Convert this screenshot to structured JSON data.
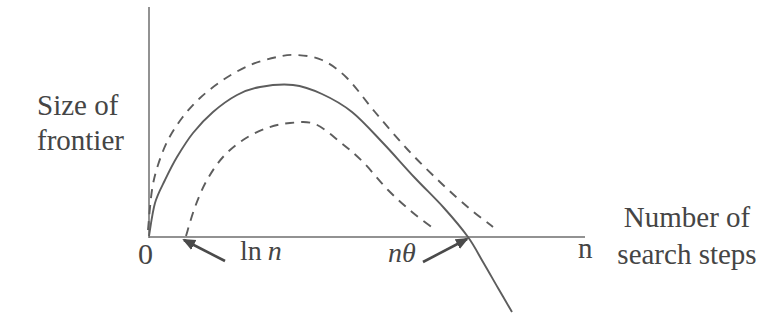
{
  "labels": {
    "y_axis": {
      "line1": "Size of",
      "line2": "frontier"
    },
    "x_axis": {
      "line1": "Number of",
      "line2": "search steps"
    },
    "origin": "0",
    "x_end": "n",
    "ln_n": {
      "prefix": "ln",
      "variable": "n"
    },
    "n_theta": {
      "variable": "n",
      "symbol": "θ"
    }
  },
  "colors": {
    "background": "#ffffff",
    "axis_line": "#6e6e6e",
    "curve_line": "#5d5d5d",
    "arrow_line": "#4a4a4a",
    "text": "#454545"
  },
  "chart_data": {
    "type": "line",
    "title": "",
    "xlabel": "Number of search steps",
    "ylabel": "Size of frontier",
    "x_tick_labels": [
      "0",
      "n"
    ],
    "x_annotations": [
      "ln n",
      "nθ"
    ],
    "grid": false,
    "legend": false,
    "canvas_px": {
      "width": 783,
      "height": 330
    },
    "axes_px": {
      "y_axis": [
        [
          149,
          7
        ],
        [
          149,
          238
        ]
      ],
      "x_axis": [
        [
          149,
          237
        ],
        [
          585,
          237
        ]
      ]
    },
    "series": [
      {
        "name": "frontier-size-solid-curve",
        "style": "solid",
        "points_px": [
          [
            149,
            236
          ],
          [
            155,
            203
          ],
          [
            165,
            180
          ],
          [
            177,
            157
          ],
          [
            193,
            133
          ],
          [
            213,
            112
          ],
          [
            237,
            95
          ],
          [
            260,
            87
          ],
          [
            293,
            85
          ],
          [
            322,
            94
          ],
          [
            352,
            112
          ],
          [
            383,
            143
          ],
          [
            415,
            178
          ],
          [
            444,
            208
          ],
          [
            468,
            237
          ],
          [
            483,
            262
          ],
          [
            498,
            288
          ],
          [
            512,
            312
          ]
        ]
      },
      {
        "name": "upper-dashed-curve",
        "style": "dashed",
        "points_px": [
          [
            148,
            230
          ],
          [
            152,
            190
          ],
          [
            158,
            165
          ],
          [
            168,
            140
          ],
          [
            182,
            118
          ],
          [
            200,
            98
          ],
          [
            223,
            80
          ],
          [
            250,
            65
          ],
          [
            277,
            57
          ],
          [
            297,
            55
          ],
          [
            322,
            60
          ],
          [
            347,
            78
          ],
          [
            375,
            112
          ],
          [
            408,
            150
          ],
          [
            441,
            183
          ],
          [
            470,
            209
          ],
          [
            493,
            227
          ]
        ]
      },
      {
        "name": "lower-dashed-curve",
        "style": "dashed",
        "points_px": [
          [
            186,
            236
          ],
          [
            195,
            207
          ],
          [
            207,
            180
          ],
          [
            223,
            157
          ],
          [
            243,
            140
          ],
          [
            267,
            128
          ],
          [
            290,
            123
          ],
          [
            315,
            124
          ],
          [
            340,
            142
          ],
          [
            363,
            162
          ],
          [
            388,
            190
          ],
          [
            412,
            212
          ],
          [
            433,
            228
          ]
        ]
      }
    ],
    "arrows_px": [
      {
        "name": "ln-n-arrow",
        "from": [
          225,
          261
        ],
        "to": [
          184,
          240
        ]
      },
      {
        "name": "n-theta-arrow",
        "from": [
          423,
          262
        ],
        "to": [
          467,
          239
        ]
      }
    ]
  }
}
